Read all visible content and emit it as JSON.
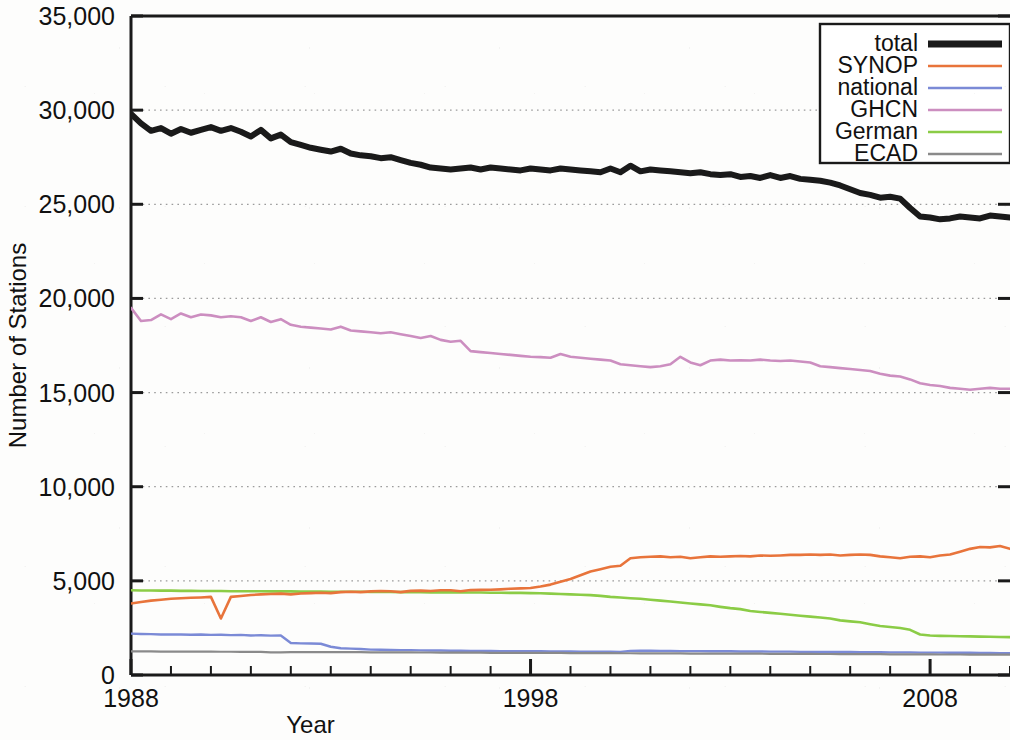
{
  "chart_data": {
    "type": "line",
    "title": "",
    "xlabel": "Year",
    "ylabel": "Number of Stations",
    "xlim": [
      1988,
      2010
    ],
    "ylim": [
      0,
      35000
    ],
    "ytick_labels": [
      "0",
      "5,000",
      "10,000",
      "15,000",
      "20,000",
      "25,000",
      "30,000",
      "35,000"
    ],
    "ytick_values": [
      0,
      5000,
      10000,
      15000,
      20000,
      25000,
      30000,
      35000
    ],
    "xtick_labels": [
      "1988",
      "1998",
      "2008"
    ],
    "xtick_values": [
      1988,
      1998,
      2008
    ],
    "xminor_step": 1,
    "grid": "horizontal-dotted",
    "legend_position": "top-right",
    "legend_entries": [
      "total",
      "SYNOP",
      "national",
      "GHCN",
      "German",
      "ECAD"
    ],
    "colors": {
      "total": "#1a1a1a",
      "SYNOP": "#e8743b",
      "national": "#7b8ad6",
      "GHCN": "#cc8ec0",
      "German": "#8bcc46",
      "ECAD": "#8a8a8a",
      "grid": "#9b9b9b",
      "axis": "#1a1a1a",
      "background": "#ffffff"
    },
    "x": [
      1988.0,
      1988.25,
      1988.5,
      1988.75,
      1989.0,
      1989.25,
      1989.5,
      1989.75,
      1990.0,
      1990.25,
      1990.5,
      1990.75,
      1991.0,
      1991.25,
      1991.5,
      1991.75,
      1992.0,
      1992.25,
      1992.5,
      1992.75,
      1993.0,
      1993.25,
      1993.5,
      1993.75,
      1994.0,
      1994.25,
      1994.5,
      1994.75,
      1995.0,
      1995.25,
      1995.5,
      1995.75,
      1996.0,
      1996.25,
      1996.5,
      1996.75,
      1997.0,
      1997.25,
      1997.5,
      1997.75,
      1998.0,
      1998.25,
      1998.5,
      1998.75,
      1999.0,
      1999.25,
      1999.5,
      1999.75,
      2000.0,
      2000.25,
      2000.5,
      2000.75,
      2001.0,
      2001.25,
      2001.5,
      2001.75,
      2002.0,
      2002.25,
      2002.5,
      2002.75,
      2003.0,
      2003.25,
      2003.5,
      2003.75,
      2004.0,
      2004.25,
      2004.5,
      2004.75,
      2005.0,
      2005.25,
      2005.5,
      2005.75,
      2006.0,
      2006.25,
      2006.5,
      2006.75,
      2007.0,
      2007.25,
      2007.5,
      2007.75,
      2008.0,
      2008.25,
      2008.5,
      2008.75,
      2009.0,
      2009.25,
      2009.5,
      2009.75,
      2010.0
    ],
    "series": [
      {
        "name": "total",
        "color": "#1a1a1a",
        "width": 6,
        "values": [
          29800,
          29300,
          28900,
          29050,
          28750,
          29000,
          28800,
          28950,
          29100,
          28900,
          29050,
          28850,
          28600,
          28950,
          28500,
          28700,
          28300,
          28150,
          28000,
          27900,
          27800,
          27950,
          27700,
          27600,
          27550,
          27450,
          27500,
          27350,
          27200,
          27100,
          26950,
          26900,
          26850,
          26900,
          26950,
          26850,
          26950,
          26900,
          26850,
          26800,
          26900,
          26850,
          26800,
          26900,
          26850,
          26800,
          26750,
          26700,
          26900,
          26700,
          27050,
          26750,
          26850,
          26800,
          26750,
          26700,
          26650,
          26700,
          26600,
          26550,
          26600,
          26450,
          26500,
          26400,
          26550,
          26400,
          26500,
          26350,
          26300,
          26250,
          26150,
          26000,
          25800,
          25600,
          25500,
          25350,
          25400,
          25300,
          24800,
          24350,
          24300,
          24200,
          24250,
          24350,
          24300,
          24250,
          24400,
          24350,
          24300
        ]
      },
      {
        "name": "SYNOP",
        "color": "#e8743b",
        "width": 2.6,
        "values": [
          3800,
          3880,
          3950,
          4000,
          4050,
          4080,
          4100,
          4120,
          4150,
          3000,
          4150,
          4200,
          4250,
          4280,
          4300,
          4320,
          4280,
          4330,
          4350,
          4370,
          4350,
          4400,
          4420,
          4400,
          4440,
          4460,
          4450,
          4400,
          4470,
          4480,
          4460,
          4500,
          4500,
          4450,
          4510,
          4520,
          4530,
          4550,
          4580,
          4600,
          4620,
          4700,
          4800,
          4950,
          5100,
          5300,
          5500,
          5620,
          5750,
          5800,
          6200,
          6250,
          6280,
          6300,
          6250,
          6280,
          6200,
          6250,
          6300,
          6280,
          6300,
          6320,
          6300,
          6350,
          6330,
          6350,
          6380,
          6380,
          6400,
          6380,
          6400,
          6350,
          6380,
          6400,
          6380,
          6300,
          6250,
          6200,
          6280,
          6300,
          6250,
          6350,
          6400,
          6550,
          6700,
          6800,
          6780,
          6850,
          6700
        ]
      },
      {
        "name": "national",
        "color": "#7b8ad6",
        "width": 2.4,
        "values": [
          2200,
          2180,
          2170,
          2150,
          2160,
          2150,
          2140,
          2150,
          2130,
          2140,
          2120,
          2130,
          2100,
          2110,
          2090,
          2100,
          1700,
          1680,
          1670,
          1660,
          1500,
          1420,
          1400,
          1380,
          1350,
          1340,
          1330,
          1320,
          1320,
          1310,
          1300,
          1300,
          1290,
          1290,
          1280,
          1280,
          1280,
          1270,
          1270,
          1260,
          1260,
          1260,
          1250,
          1250,
          1250,
          1240,
          1240,
          1240,
          1240,
          1230,
          1280,
          1290,
          1290,
          1280,
          1280,
          1270,
          1270,
          1270,
          1260,
          1260,
          1260,
          1250,
          1250,
          1250,
          1240,
          1240,
          1240,
          1230,
          1230,
          1230,
          1220,
          1220,
          1220,
          1210,
          1210,
          1210,
          1200,
          1200,
          1200,
          1190,
          1190,
          1190,
          1180,
          1180,
          1180,
          1170,
          1170,
          1160,
          1160
        ]
      },
      {
        "name": "GHCN",
        "color": "#cc8ec0",
        "width": 2.6,
        "values": [
          19500,
          18800,
          18850,
          19150,
          18900,
          19200,
          19000,
          19150,
          19100,
          19000,
          19050,
          19000,
          18800,
          19000,
          18750,
          18900,
          18600,
          18500,
          18450,
          18400,
          18350,
          18500,
          18300,
          18250,
          18200,
          18150,
          18200,
          18100,
          18000,
          17900,
          18000,
          17800,
          17700,
          17750,
          17200,
          17150,
          17100,
          17050,
          17000,
          16950,
          16900,
          16880,
          16850,
          17050,
          16900,
          16850,
          16800,
          16750,
          16700,
          16500,
          16450,
          16400,
          16350,
          16400,
          16500,
          16900,
          16600,
          16450,
          16700,
          16750,
          16700,
          16720,
          16700,
          16750,
          16700,
          16680,
          16700,
          16650,
          16600,
          16400,
          16350,
          16300,
          16250,
          16200,
          16150,
          16000,
          15900,
          15850,
          15700,
          15500,
          15400,
          15350,
          15250,
          15200,
          15150,
          15200,
          15250,
          15200,
          15200
        ]
      },
      {
        "name": "German",
        "color": "#8bcc46",
        "width": 2.6,
        "values": [
          4500,
          4490,
          4490,
          4480,
          4480,
          4470,
          4470,
          4460,
          4460,
          4460,
          4450,
          4450,
          4450,
          4450,
          4440,
          4440,
          4440,
          4430,
          4430,
          4430,
          4420,
          4420,
          4420,
          4420,
          4410,
          4410,
          4410,
          4400,
          4400,
          4400,
          4390,
          4390,
          4390,
          4380,
          4380,
          4380,
          4370,
          4370,
          4360,
          4360,
          4350,
          4340,
          4320,
          4300,
          4280,
          4260,
          4240,
          4200,
          4150,
          4120,
          4080,
          4050,
          4000,
          3950,
          3900,
          3850,
          3800,
          3750,
          3700,
          3620,
          3550,
          3500,
          3400,
          3350,
          3300,
          3250,
          3200,
          3150,
          3100,
          3050,
          3000,
          2900,
          2850,
          2800,
          2700,
          2600,
          2550,
          2500,
          2400,
          2150,
          2100,
          2080,
          2070,
          2060,
          2050,
          2040,
          2030,
          2020,
          2010
        ]
      },
      {
        "name": "ECAD",
        "color": "#8a8a8a",
        "width": 2.2,
        "values": [
          1250,
          1250,
          1250,
          1245,
          1245,
          1240,
          1240,
          1240,
          1240,
          1235,
          1235,
          1230,
          1230,
          1230,
          1200,
          1200,
          1220,
          1220,
          1220,
          1215,
          1215,
          1210,
          1210,
          1210,
          1205,
          1205,
          1200,
          1200,
          1200,
          1195,
          1195,
          1190,
          1190,
          1190,
          1185,
          1185,
          1180,
          1180,
          1180,
          1175,
          1175,
          1170,
          1170,
          1170,
          1165,
          1165,
          1160,
          1160,
          1160,
          1155,
          1155,
          1150,
          1150,
          1150,
          1145,
          1145,
          1140,
          1140,
          1140,
          1135,
          1135,
          1130,
          1130,
          1130,
          1125,
          1125,
          1120,
          1120,
          1120,
          1115,
          1115,
          1110,
          1110,
          1110,
          1105,
          1105,
          1100,
          1100,
          1100,
          1095,
          1095,
          1090,
          1090,
          1090,
          1085,
          1085,
          1080,
          1080,
          1080
        ]
      }
    ]
  }
}
